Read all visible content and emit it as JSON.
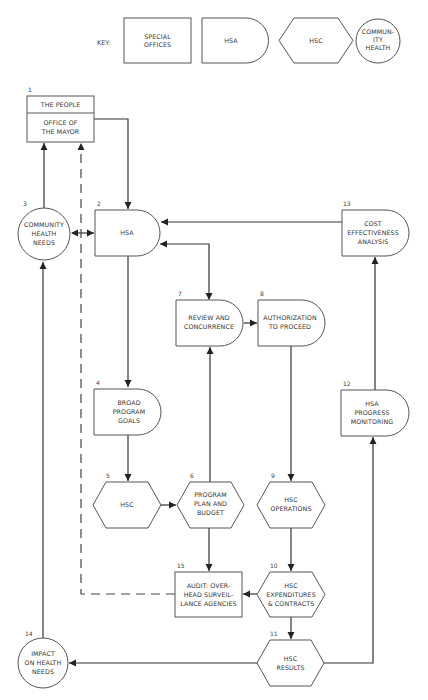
{
  "key": {
    "label": "KEY:",
    "items": [
      {
        "shape": "rectangle",
        "lines": [
          "SPECIAL",
          "OFFICES"
        ]
      },
      {
        "shape": "d-shape",
        "lines": [
          "HSA"
        ]
      },
      {
        "shape": "hexagon",
        "lines": [
          "HSC"
        ]
      },
      {
        "shape": "circle",
        "lines": [
          "COMMUN-",
          "ITY",
          "HEALTH"
        ]
      }
    ]
  },
  "nodes": {
    "n1": {
      "number": "1",
      "top": "THE PEOPLE",
      "lines": [
        "OFFICE OF",
        "THE MAYOR"
      ]
    },
    "n2": {
      "number": "2",
      "lines": [
        "HSA"
      ]
    },
    "n3": {
      "number": "3",
      "lines": [
        "COMMUNITY",
        "HEALTH",
        "NEEDS"
      ]
    },
    "n4": {
      "number": "4",
      "lines": [
        "BROAD",
        "PROGRAM",
        "GOALS"
      ]
    },
    "n5": {
      "number": "5",
      "lines": [
        "HSC"
      ]
    },
    "n6": {
      "number": "6",
      "lines": [
        "PROGRAM",
        "PLAN AND",
        "BUDGET"
      ]
    },
    "n7": {
      "number": "7",
      "lines": [
        "REVIEW AND",
        "CONCURRENCE"
      ]
    },
    "n8": {
      "number": "8",
      "lines": [
        "AUTHORIZATION",
        "TO PROCEED"
      ]
    },
    "n9": {
      "number": "9",
      "lines": [
        "HSC",
        "OPERATIONS"
      ]
    },
    "n10": {
      "number": "10",
      "lines": [
        "HSC",
        "EXPENDITURES",
        "& CONTRACTS"
      ]
    },
    "n11": {
      "number": "11",
      "lines": [
        "HSC",
        "RESULTS"
      ]
    },
    "n12": {
      "number": "12",
      "lines": [
        "HSA",
        "PROGRESS",
        "MONITORING"
      ]
    },
    "n13": {
      "number": "13",
      "lines": [
        "COST",
        "EFFECTIVENESS",
        "ANALYSIS"
      ]
    },
    "n14": {
      "number": "14",
      "lines": [
        "IMPACT",
        "ON HEALTH",
        "NEEDS"
      ]
    },
    "n15": {
      "number": "15",
      "lines": [
        "AUDIT: OVER-",
        "HEAD SURVEIL-",
        "LANCE AGENCIES"
      ]
    }
  },
  "edges": [
    {
      "from": "1",
      "to": "2",
      "style": "solid"
    },
    {
      "from": "3",
      "to": "1",
      "style": "solid"
    },
    {
      "from": "3",
      "to": "2",
      "style": "solid",
      "bidirectional": true
    },
    {
      "from": "13",
      "to": "2",
      "style": "solid"
    },
    {
      "from": "2",
      "to": "7",
      "style": "solid",
      "bidirectional": true
    },
    {
      "from": "2",
      "to": "4",
      "style": "solid"
    },
    {
      "from": "7",
      "to": "8",
      "style": "solid"
    },
    {
      "from": "8",
      "to": "9",
      "style": "solid"
    },
    {
      "from": "4",
      "to": "5",
      "style": "solid"
    },
    {
      "from": "5",
      "to": "6",
      "style": "solid"
    },
    {
      "from": "6",
      "to": "7",
      "style": "solid"
    },
    {
      "from": "6",
      "to": "15",
      "style": "solid"
    },
    {
      "from": "9",
      "to": "10",
      "style": "solid"
    },
    {
      "from": "10",
      "to": "15",
      "style": "solid"
    },
    {
      "from": "15",
      "to": "1",
      "style": "dashed"
    },
    {
      "from": "10",
      "to": "11",
      "style": "solid"
    },
    {
      "from": "11",
      "to": "14",
      "style": "solid"
    },
    {
      "from": "11",
      "to": "12",
      "style": "solid"
    },
    {
      "from": "12",
      "to": "13",
      "style": "solid"
    },
    {
      "from": "14",
      "to": "3",
      "style": "solid"
    }
  ]
}
